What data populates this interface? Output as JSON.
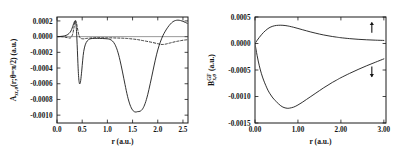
{
  "figure": {
    "panels": [
      "left",
      "right"
    ],
    "background": "#ffffff",
    "ink": "#141414"
  },
  "left_panel": {
    "ylabel_main": "A",
    "ylabel_sub": "xc,σ",
    "ylabel_rest": "(r;θ=π/2)  (a.u.)",
    "xlabel": "r  (a.u.)",
    "ytick_labels": [
      "0.0002",
      "0.0000",
      "-0.0002",
      "-0.0004",
      "-0.0006",
      "-0.0008",
      "-0.0010"
    ],
    "ytick_values": [
      0.0002,
      0.0,
      -0.0002,
      -0.0004,
      -0.0006,
      -0.0008,
      -0.001
    ],
    "xtick_labels": [
      "0.0",
      "0.5",
      "1.0",
      "1.5",
      "2.0",
      "2.5"
    ],
    "xtick_values": [
      0.0,
      0.5,
      1.0,
      1.5,
      2.0,
      2.5
    ]
  },
  "right_panel": {
    "ylabel_main": "B",
    "ylabel_sub": "x,σ",
    "ylabel_sup": "GF",
    "ylabel_rest": "(a.u.)",
    "xlabel": "r  (a.u.)",
    "ytick_labels": [
      "0.0005",
      "0.0000",
      "-0.0005",
      "-0.0010",
      "-0.0015"
    ],
    "ytick_values": [
      0.0005,
      0.0,
      -0.0005,
      -0.001,
      -0.0015
    ],
    "xtick_labels": [
      "0.00",
      "1.00",
      "2.00",
      "3.00"
    ],
    "xtick_values": [
      0.0,
      1.0,
      2.0,
      3.0
    ],
    "annotations": [
      {
        "name": "spin-up-arrow",
        "symbol": "↑",
        "x": 2.72,
        "y": 0.0003
      },
      {
        "name": "spin-down-arrow",
        "symbol": "↓",
        "x": 2.72,
        "y": -0.00053
      }
    ]
  },
  "chart_data": [
    {
      "type": "line",
      "panel": "left",
      "title": "",
      "xlabel": "r  (a.u.)",
      "ylabel": "A_xc,σ(r;θ=π/2)  (a.u.)",
      "xlim": [
        0.0,
        2.6
      ],
      "ylim": [
        -0.0011,
        0.00025
      ],
      "grid": false,
      "legend": "none",
      "series": [
        {
          "name": "solid",
          "style": "solid",
          "x": [
            0.0,
            0.06,
            0.12,
            0.18,
            0.22,
            0.26,
            0.29,
            0.31,
            0.33,
            0.345,
            0.355,
            0.365,
            0.375,
            0.385,
            0.395,
            0.405,
            0.415,
            0.425,
            0.435,
            0.445,
            0.455,
            0.47,
            0.49,
            0.51,
            0.53,
            0.56,
            0.6,
            0.65,
            0.7,
            0.75,
            0.8,
            0.9,
            1.0,
            1.05,
            1.1,
            1.15,
            1.2,
            1.25,
            1.3,
            1.35,
            1.4,
            1.45,
            1.5,
            1.55,
            1.6,
            1.65,
            1.7,
            1.75,
            1.8,
            1.85,
            1.9,
            1.95,
            2.0,
            2.05,
            2.1,
            2.15,
            2.2,
            2.25,
            2.3,
            2.35,
            2.4,
            2.45,
            2.5,
            2.55,
            2.6
          ],
          "y": [
            0.0,
            2e-06,
            6e-06,
            1.6e-05,
            3e-05,
            5.5e-05,
            9e-05,
            0.000125,
            0.000165,
            0.00019,
            0.0002,
            0.000195,
            0.00016,
            9e-05,
            -3e-05,
            -0.00018,
            -0.00034,
            -0.00047,
            -0.000555,
            -0.000595,
            -0.0006,
            -0.00056,
            -0.00044,
            -0.0003,
            -0.00019,
            -0.000105,
            -5.5e-05,
            -3e-05,
            -2.4e-05,
            -2.2e-05,
            -2.2e-05,
            -2.4e-05,
            -2.8e-05,
            -3.5e-05,
            -5.5e-05,
            -0.0001,
            -0.00018,
            -0.0003,
            -0.00045,
            -0.00061,
            -0.00076,
            -0.00087,
            -0.000935,
            -0.00096,
            -0.000955,
            -0.00095,
            -0.00092,
            -0.00085,
            -0.00074,
            -0.0006,
            -0.00045,
            -0.0003,
            -0.00017,
            -7e-05,
            1e-05,
            7e-05,
            0.00012,
            0.00016,
            0.00019,
            0.000205,
            0.00021,
            0.000205,
            0.000195,
            0.00018,
            0.000165
          ]
        },
        {
          "name": "dashed",
          "style": "dashed",
          "x": [
            0.0,
            0.05,
            0.1,
            0.15,
            0.2,
            0.25,
            0.28,
            0.31,
            0.335,
            0.355,
            0.37,
            0.385,
            0.4,
            0.42,
            0.44,
            0.46,
            0.48,
            0.52,
            0.56,
            0.6,
            0.66,
            0.72,
            0.8,
            0.9,
            1.0,
            1.1,
            1.2,
            1.3,
            1.4,
            1.5,
            1.6,
            1.7,
            1.8,
            1.9,
            2.0,
            2.05,
            2.1,
            2.15,
            2.2,
            2.25,
            2.3,
            2.35,
            2.4,
            2.45,
            2.5,
            2.55,
            2.6
          ],
          "y": [
            0.0,
            0.0,
            -2e-06,
            -6e-06,
            -1.2e-05,
            -1.8e-05,
            -1e-05,
            3e-05,
            0.00011,
            0.00019,
            0.000205,
            0.00018,
            0.00013,
            6e-05,
            1e-05,
            -1.5e-05,
            -2.5e-05,
            -2.8e-05,
            -2.5e-05,
            -2.2e-05,
            -1.8e-05,
            -1.5e-05,
            -1.4e-05,
            -1.4e-05,
            -1.5e-05,
            -1.6e-05,
            -1.8e-05,
            -2e-05,
            -2.4e-05,
            -3e-05,
            -3.8e-05,
            -5e-05,
            -6.2e-05,
            -7.5e-05,
            -9e-05,
            -9.8e-05,
            -0.0001,
            -9.6e-05,
            -8.8e-05,
            -8e-05,
            -7.2e-05,
            -6.4e-05,
            -5.8e-05,
            -5.2e-05,
            -4.6e-05,
            -4.2e-05,
            -3.8e-05
          ]
        }
      ]
    },
    {
      "type": "line",
      "panel": "right",
      "title": "",
      "xlabel": "r  (a.u.)",
      "ylabel": "B_x,σ^GF  (a.u.)",
      "xlim": [
        0.0,
        3.05
      ],
      "ylim": [
        -0.0015,
        0.0005
      ],
      "grid": false,
      "legend": "none",
      "series": [
        {
          "name": "spin-up",
          "style": "solid",
          "x": [
            0.0,
            0.05,
            0.1,
            0.15,
            0.2,
            0.25,
            0.3,
            0.35,
            0.4,
            0.45,
            0.5,
            0.55,
            0.6,
            0.65,
            0.7,
            0.75,
            0.8,
            0.9,
            1.0,
            1.1,
            1.2,
            1.3,
            1.4,
            1.5,
            1.6,
            1.7,
            1.8,
            1.9,
            2.0,
            2.2,
            2.4,
            2.6,
            2.8,
            3.0
          ],
          "y": [
            0.0,
            6e-05,
            0.000115,
            0.000165,
            0.00021,
            0.000248,
            0.00028,
            0.000305,
            0.000322,
            0.000334,
            0.000341,
            0.000344,
            0.000345,
            0.000343,
            0.000339,
            0.000333,
            0.000325,
            0.000306,
            0.000284,
            0.000261,
            0.000239,
            0.000217,
            0.000197,
            0.000178,
            0.000161,
            0.000146,
            0.000132,
            0.00012,
            0.000109,
            9.2e-05,
            7.9e-05,
            7e-05,
            6.3e-05,
            5.8e-05
          ]
        },
        {
          "name": "spin-down",
          "style": "solid",
          "x": [
            0.0,
            0.05,
            0.1,
            0.15,
            0.2,
            0.25,
            0.3,
            0.35,
            0.4,
            0.45,
            0.5,
            0.55,
            0.6,
            0.65,
            0.7,
            0.75,
            0.8,
            0.9,
            1.0,
            1.1,
            1.2,
            1.3,
            1.4,
            1.5,
            1.6,
            1.7,
            1.8,
            1.9,
            2.0,
            2.2,
            2.4,
            2.6,
            2.8,
            3.0
          ],
          "y": [
            0.0,
            -0.00023,
            -0.00042,
            -0.00057,
            -0.00069,
            -0.00079,
            -0.00088,
            -0.00095,
            -0.00101,
            -0.00106,
            -0.0011,
            -0.00114,
            -0.001175,
            -0.0012,
            -0.001215,
            -0.001222,
            -0.00122,
            -0.0012,
            -0.00116,
            -0.00111,
            -0.001055,
            -0.001,
            -0.000945,
            -0.00089,
            -0.000835,
            -0.000785,
            -0.000735,
            -0.00069,
            -0.000645,
            -0.000565,
            -0.00049,
            -0.00042,
            -0.000355,
            -0.00029
          ]
        }
      ]
    }
  ]
}
